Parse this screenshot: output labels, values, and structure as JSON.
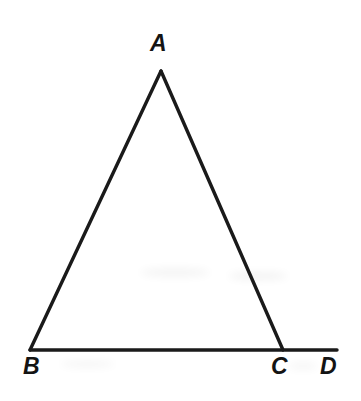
{
  "figure": {
    "background_color": "#ffffff",
    "stroke_color": "#1a1a1a",
    "stroke_width": 3.4,
    "label_color": "#141414",
    "width": 361,
    "height": 401
  },
  "points": {
    "A": {
      "label": "A",
      "x": 161,
      "y": 71
    },
    "B": {
      "label": "B",
      "x": 30,
      "y": 350
    },
    "C": {
      "label": "C",
      "x": 283,
      "y": 350
    },
    "D": {
      "label": "D",
      "x": 337,
      "y": 350
    }
  },
  "labels": {
    "A": {
      "text": "A",
      "left": 150,
      "top": 32
    },
    "B": {
      "text": "B",
      "left": 23,
      "top": 355
    },
    "C": {
      "text": "C",
      "left": 271,
      "top": 355
    },
    "D": {
      "text": "D",
      "left": 320,
      "top": 355
    }
  },
  "segments": [
    {
      "name": "side-AB",
      "from": "A",
      "to": "B"
    },
    {
      "name": "side-AC",
      "from": "A",
      "to": "C"
    },
    {
      "name": "base-BD",
      "from": "B",
      "to": "D"
    }
  ],
  "chart_data": {
    "type": "diagram",
    "shape": "triangle-with-exterior-angle",
    "vertices": [
      {
        "id": "A",
        "label": "A",
        "x": 161,
        "y": 71
      },
      {
        "id": "B",
        "label": "B",
        "x": 30,
        "y": 350
      },
      {
        "id": "C",
        "label": "C",
        "x": 283,
        "y": 350
      },
      {
        "id": "D",
        "label": "D",
        "x": 337,
        "y": 350
      }
    ],
    "edges": [
      {
        "from": "A",
        "to": "B",
        "label": "AB"
      },
      {
        "from": "A",
        "to": "C",
        "label": "AC"
      },
      {
        "from": "B",
        "to": "C",
        "label": "BC"
      },
      {
        "from": "C",
        "to": "D",
        "label": "CD"
      }
    ],
    "annotations": [],
    "legend": [],
    "grid": false
  }
}
